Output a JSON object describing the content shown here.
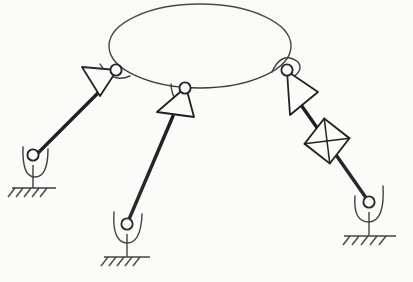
{
  "figure": {
    "kind": "kinematic-schematic",
    "canvas": {
      "width": 413,
      "height": 282
    },
    "background_color": "#fbfbf9",
    "ink_color": "#111111",
    "thin_stroke_color": "#2a2a2a",
    "thin_stroke_width": 1.4,
    "thick_stroke_width": 3.4,
    "platform": {
      "name": "moving-platform",
      "shape": "ellipse",
      "cx": 200,
      "cy": 46,
      "rx": 91,
      "ry": 42
    },
    "legs": [
      {
        "id": "leg-left",
        "label": "left-limb",
        "platform_joint": {
          "cx": 116,
          "cy": 70,
          "r": 5.6
        },
        "bracket_path": "M 100 64 Q 112 84 130 76",
        "actuator_triangle": [
          [
            82,
            67
          ],
          [
            117,
            70
          ],
          [
            100,
            96
          ]
        ],
        "link_line": {
          "x1": 99,
          "y1": 92,
          "x2": 36,
          "y2": 155
        },
        "ground_joint": {
          "cx": 33,
          "cy": 155,
          "r": 5.6
        },
        "cradle_path": "M 23 147 Q 22 176 34 177 Q 48 178 48 149",
        "stem": {
          "x1": 33,
          "y1": 165,
          "x2": 33,
          "y2": 188
        },
        "ground_line": {
          "x1": 12,
          "y1": 188,
          "x2": 56,
          "y2": 188
        },
        "hatch_count": 5,
        "hatch_start_x": 15,
        "hatch_step": 8,
        "hatch_dx": -7,
        "hatch_dy": 9
      },
      {
        "id": "leg-middle",
        "label": "middle-limb",
        "platform_joint": {
          "cx": 185,
          "cy": 88,
          "r": 5.6
        },
        "bracket_path": "M 171 84 Q 172 106 190 104",
        "actuator_triangle": [
          [
            157,
            112
          ],
          [
            186,
            87
          ],
          [
            194,
            117
          ]
        ],
        "link_line": {
          "x1": 173,
          "y1": 116,
          "x2": 127,
          "y2": 224
        },
        "ground_joint": {
          "cx": 127,
          "cy": 224,
          "r": 5.6
        },
        "cradle_path": "M 114 212 Q 112 241 126 243 Q 141 244 142 214",
        "stem": {
          "x1": 127,
          "y1": 234,
          "x2": 127,
          "y2": 257
        },
        "ground_line": {
          "x1": 104,
          "y1": 257,
          "x2": 150,
          "y2": 257
        },
        "hatch_count": 5,
        "hatch_start_x": 108,
        "hatch_step": 8,
        "hatch_dx": -7,
        "hatch_dy": 9
      },
      {
        "id": "leg-right",
        "label": "right-limb",
        "platform_joint": {
          "cx": 287,
          "cy": 70,
          "r": 5.6
        },
        "bracket_path": "M 272 72 Q 282 50 298 62 Q 304 70 292 78",
        "actuator_triangle": [
          [
            287,
            71
          ],
          [
            318,
            92
          ],
          [
            290,
            115
          ]
        ],
        "link_line": {
          "x1": 292,
          "y1": 92,
          "x2": 369,
          "y2": 202
        },
        "prismatic_square": {
          "cx": 327,
          "cy": 141,
          "half": 16,
          "rotation_deg": 38
        },
        "ground_joint": {
          "cx": 369,
          "cy": 202,
          "r": 5.6
        },
        "cradle_path": "M 355 196 Q 353 222 369 222 Q 385 221 383 186",
        "stem": {
          "x1": 369,
          "y1": 212,
          "x2": 369,
          "y2": 236
        },
        "ground_line": {
          "x1": 344,
          "y1": 236,
          "x2": 396,
          "y2": 236
        },
        "hatch_count": 5,
        "hatch_start_x": 350,
        "hatch_step": 9,
        "hatch_dx": -7,
        "hatch_dy": 9
      }
    ]
  }
}
